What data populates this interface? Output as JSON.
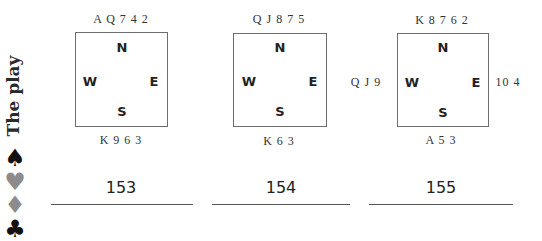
{
  "sidebar": {
    "title": "The play",
    "suits": [
      {
        "name": "spade",
        "glyph": "♠",
        "color": "#111111"
      },
      {
        "name": "heart",
        "glyph": "♥",
        "color": "#8c8c8c"
      },
      {
        "name": "diamond",
        "glyph": "♦",
        "color": "#8c8c8c"
      },
      {
        "name": "club",
        "glyph": "♣",
        "color": "#111111"
      }
    ]
  },
  "compass": {
    "north": "N",
    "south": "S",
    "west": "W",
    "east": "E"
  },
  "deals": [
    {
      "number": "153",
      "north": "A Q 7 4 2",
      "south": "K 9 6 3",
      "west": "",
      "east": ""
    },
    {
      "number": "154",
      "north": "Q J 8 7 5",
      "south": "K 6 3",
      "west": "",
      "east": ""
    },
    {
      "number": "155",
      "north": "K 8 7 6 2",
      "south": "A 5 3",
      "west": "Q J 9",
      "east": "10 4"
    }
  ]
}
